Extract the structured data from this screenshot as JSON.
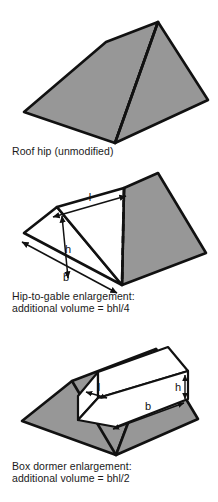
{
  "document": {
    "type": "technical-illustration",
    "subject": "Roof enlargement volume diagrams",
    "background_color": "#ffffff",
    "fill_gray": "#979797",
    "stroke_color": "#111111"
  },
  "figures": [
    {
      "id": "roof-hip-unmodified",
      "caption_line1": "Roof hip (unmodified)",
      "caption_line2": "",
      "labels": [],
      "description": "Hipped roof drawn in oblique projection, fully shaded gray, with a ridge line running from the upper apex down to the near bottom corner."
    },
    {
      "id": "hip-to-gable-enlargement",
      "caption_line1": "Hip-to-gable enlargement:",
      "caption_line2": "additional volume = bhl/4",
      "labels": [
        {
          "name": "length-label",
          "text": "l"
        },
        {
          "name": "height-label",
          "text": "h"
        },
        {
          "name": "breadth-label",
          "text": "b"
        }
      ],
      "description": "Same hipped roof with the near hip end replaced by a gable; the added wedge is drawn unshaded with dimension arrows for l (ridge extension), h (height) and b (breadth). A dashed line marks the original hip edge."
    },
    {
      "id": "box-dormer-enlargement",
      "caption_line1": "Box dormer enlargement:",
      "caption_line2": "additional volume = bhl/2",
      "labels": [
        {
          "name": "length-label",
          "text": "l"
        },
        {
          "name": "height-label",
          "text": "h"
        },
        {
          "name": "breadth-label",
          "text": "b"
        }
      ],
      "description": "Shaded hipped roof with an unshaded rectangular box dormer sitting on the rear slope; dimension arrows label l (depth), h (height) and b (breadth)."
    }
  ]
}
